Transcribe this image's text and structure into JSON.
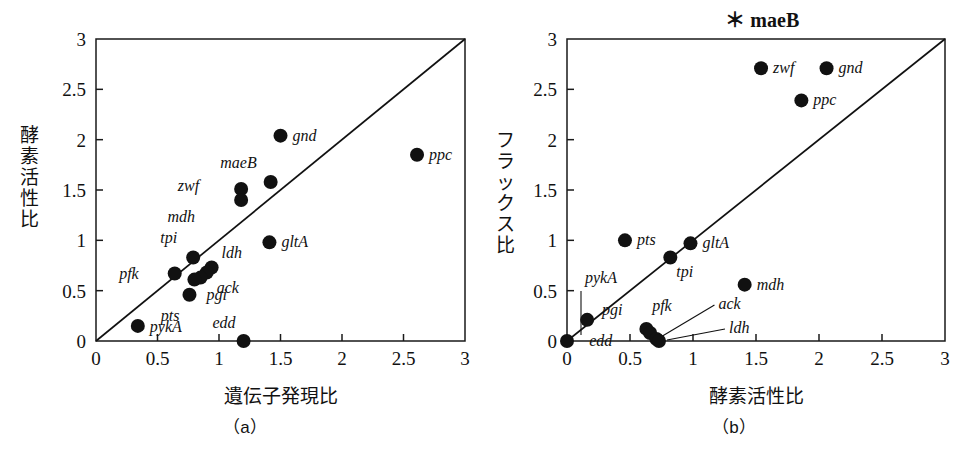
{
  "figure": {
    "background": "#ffffff",
    "ink_color": "#111111"
  },
  "panel_a": {
    "caption": "（a）",
    "xlabel": "遺伝子発現比",
    "ylabel": "酵素活性比",
    "tick_labels": [
      "0",
      "0.5",
      "1",
      "1.5",
      "2",
      "2.5",
      "3"
    ]
  },
  "panel_b": {
    "caption": "（b）",
    "xlabel": "酵素活性比",
    "ylabel": "フラックス比",
    "tick_labels": [
      "0",
      "0.5",
      "1",
      "1.5",
      "2",
      "2.5",
      "3"
    ],
    "note": "＊ maeB",
    "note_star": "＊",
    "note_gene": "maeB"
  },
  "chart_data": [
    {
      "type": "scatter",
      "panel": "(a)",
      "title": "（a）",
      "xlabel": "遺伝子発現比",
      "ylabel": "酵素活性比",
      "xlim": [
        0,
        3
      ],
      "ylim": [
        0,
        3
      ],
      "xticks": [
        0,
        0.5,
        1,
        1.5,
        2,
        2.5,
        3
      ],
      "yticks": [
        0,
        0.5,
        1,
        1.5,
        2,
        2.5,
        3
      ],
      "grid": false,
      "legend": "none",
      "reference_line": {
        "type": "identity",
        "from": [
          0,
          0
        ],
        "to": [
          3,
          3
        ]
      },
      "points": [
        {
          "label": "gnd",
          "x": 1.5,
          "y": 2.04,
          "label_dx": 12,
          "label_dy": 5
        },
        {
          "label": "ppc",
          "x": 2.61,
          "y": 1.85,
          "label_dx": 12,
          "label_dy": 5
        },
        {
          "label": "maeB",
          "x": 1.42,
          "y": 1.58,
          "label_dx": -14,
          "label_dy": -14
        },
        {
          "label": "zwf",
          "x": 1.18,
          "y": 1.51,
          "label_dx": -42,
          "label_dy": 2
        },
        {
          "label": "mdh",
          "x": 1.18,
          "y": 1.4,
          "label_dx": -46,
          "label_dy": 22
        },
        {
          "label": "gltA",
          "x": 1.41,
          "y": 0.98,
          "label_dx": 12,
          "label_dy": 5
        },
        {
          "label": "tpi",
          "x": 0.79,
          "y": 0.83,
          "label_dx": -16,
          "label_dy": -14
        },
        {
          "label": "ldh",
          "x": 0.94,
          "y": 0.73,
          "label_dx": 10,
          "label_dy": -10
        },
        {
          "label": "pfk",
          "x": 0.64,
          "y": 0.67,
          "label_dx": -36,
          "label_dy": 5
        },
        {
          "label": "ack",
          "x": 0.9,
          "y": 0.68,
          "label_dx": 10,
          "label_dy": 20
        },
        {
          "label": "pgi",
          "x": 0.85,
          "y": 0.63,
          "label_dx": 6,
          "label_dy": 22
        },
        {
          "label": "",
          "x": 0.8,
          "y": 0.61,
          "label_dx": 0,
          "label_dy": 0
        },
        {
          "label": "pts",
          "x": 0.76,
          "y": 0.46,
          "label_dx": -10,
          "label_dy": 26
        },
        {
          "label": "pykA",
          "x": 0.34,
          "y": 0.15,
          "label_dx": 12,
          "label_dy": 6
        },
        {
          "label": "edd",
          "x": 1.2,
          "y": 0.0,
          "label_dx": -8,
          "label_dy": -13
        }
      ]
    },
    {
      "type": "scatter",
      "panel": "(b)",
      "title": "（b）",
      "xlabel": "酵素活性比",
      "ylabel": "フラックス比",
      "xlim": [
        0,
        3
      ],
      "ylim": [
        0,
        3
      ],
      "xticks": [
        0,
        0.5,
        1,
        1.5,
        2,
        2.5,
        3
      ],
      "yticks": [
        0,
        0.5,
        1,
        1.5,
        2,
        2.5,
        3
      ],
      "grid": false,
      "legend": "none",
      "annotation": "＊ maeB",
      "reference_line": {
        "type": "identity",
        "from": [
          0,
          0
        ],
        "to": [
          3,
          3
        ]
      },
      "points": [
        {
          "label": "zwf",
          "x": 1.54,
          "y": 2.71,
          "label_dx": 12,
          "label_dy": 5
        },
        {
          "label": "gnd",
          "x": 2.06,
          "y": 2.71,
          "label_dx": 12,
          "label_dy": 5
        },
        {
          "label": "ppc",
          "x": 1.86,
          "y": 2.39,
          "label_dx": 12,
          "label_dy": 5
        },
        {
          "label": "pts",
          "x": 0.46,
          "y": 1.0,
          "label_dx": 12,
          "label_dy": 5
        },
        {
          "label": "gltA",
          "x": 0.98,
          "y": 0.97,
          "label_dx": 12,
          "label_dy": 5
        },
        {
          "label": "tpi",
          "x": 0.82,
          "y": 0.83,
          "label_dx": 6,
          "label_dy": 20
        },
        {
          "label": "mdh",
          "x": 1.41,
          "y": 0.56,
          "label_dx": 12,
          "label_dy": 5
        },
        {
          "label": "pykA",
          "x": 0.0,
          "y": 0.0,
          "label_dx": 18,
          "label_dy": -58
        },
        {
          "label": "edd",
          "x": 0.16,
          "y": 0.21,
          "label_dx": 2,
          "label_dy": 26
        },
        {
          "label": "pgi",
          "x": 0.63,
          "y": 0.12,
          "label_dx": -24,
          "label_dy": -14
        },
        {
          "label": "pfk",
          "x": 0.66,
          "y": 0.08,
          "label_dx": 2,
          "label_dy": -22
        },
        {
          "label": "ack",
          "x": 0.71,
          "y": 0.02,
          "label_dx": 62,
          "label_dy": -30
        },
        {
          "label": "ldh",
          "x": 0.73,
          "y": 0.0,
          "label_dx": 70,
          "label_dy": -8
        }
      ]
    }
  ]
}
